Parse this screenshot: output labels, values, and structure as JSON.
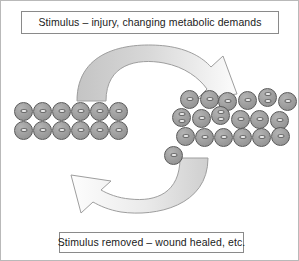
{
  "figure": {
    "background_color": "#ffffff",
    "border_color": "#b9b9b9",
    "width": 299,
    "height": 261
  },
  "stimulus_box": {
    "label": "Stimulus – injury, changing metabolic demands",
    "border_color": "#8a8a8a",
    "text_color": "#1a1a1a"
  },
  "removal_box": {
    "label": "Stimulus removed – wound healed, etc.",
    "border_color": "#8a8a8a",
    "text_color": "#1a1a1a"
  },
  "arrows": {
    "forward": {
      "name": "curved-arrow-right",
      "direction": "left-to-right",
      "fill_start": "#c9c9c9",
      "fill_end": "#fbfbfb",
      "stroke": "#9a9a9a"
    },
    "reverse": {
      "name": "curved-arrow-left",
      "direction": "right-to-left",
      "fill_start": "#fdfdfd",
      "fill_end": "#d2d2d2",
      "stroke": "#9a9a9a"
    }
  },
  "cells": {
    "fill_color": "#9a9a9a",
    "outline_color": "#595959",
    "nucleus_color": "#efefef",
    "normal_tissue": {
      "name": "normal-cell-population",
      "rows": 2,
      "columns": 6,
      "total": 12,
      "dividing": 0,
      "cell_list": [
        {
          "x": 0,
          "y": 0,
          "nuclei": 1
        },
        {
          "x": 19,
          "y": 0,
          "nuclei": 1
        },
        {
          "x": 38,
          "y": 0,
          "nuclei": 1
        },
        {
          "x": 57,
          "y": 0,
          "nuclei": 1
        },
        {
          "x": 76,
          "y": 0,
          "nuclei": 1
        },
        {
          "x": 95,
          "y": 0,
          "nuclei": 1
        },
        {
          "x": 0,
          "y": 19,
          "nuclei": 1
        },
        {
          "x": 19,
          "y": 19,
          "nuclei": 1
        },
        {
          "x": 38,
          "y": 19,
          "nuclei": 1
        },
        {
          "x": 57,
          "y": 19,
          "nuclei": 1
        },
        {
          "x": 76,
          "y": 19,
          "nuclei": 1
        },
        {
          "x": 95,
          "y": 19,
          "nuclei": 1
        }
      ]
    },
    "hyperplastic_tissue": {
      "name": "hyperplastic-cell-population",
      "rows": 3,
      "total": 19,
      "dividing": 4,
      "cell_list": [
        {
          "x": 8,
          "y": 0,
          "nuclei": 1
        },
        {
          "x": 28,
          "y": 0,
          "nuclei": 1
        },
        {
          "x": 46,
          "y": 2,
          "nuclei": 1
        },
        {
          "x": 66,
          "y": 1,
          "nuclei": 1
        },
        {
          "x": 86,
          "y": -2,
          "nuclei": 2
        },
        {
          "x": 106,
          "y": 2,
          "nuclei": 1
        },
        {
          "x": 0,
          "y": 18,
          "nuclei": 2
        },
        {
          "x": 20,
          "y": 19,
          "nuclei": 1
        },
        {
          "x": 39,
          "y": 16,
          "nuclei": 2
        },
        {
          "x": 59,
          "y": 20,
          "nuclei": 1
        },
        {
          "x": 78,
          "y": 20,
          "nuclei": 1
        },
        {
          "x": 98,
          "y": 21,
          "nuclei": 1
        },
        {
          "x": 4,
          "y": 37,
          "nuclei": 1
        },
        {
          "x": 23,
          "y": 38,
          "nuclei": 1
        },
        {
          "x": 42,
          "y": 38,
          "nuclei": 1
        },
        {
          "x": 61,
          "y": 38,
          "nuclei": 1
        },
        {
          "x": 80,
          "y": 38,
          "nuclei": 1
        },
        {
          "x": 99,
          "y": 37,
          "nuclei": 1
        },
        {
          "x": -8,
          "y": 56,
          "nuclei": 1
        }
      ]
    }
  }
}
